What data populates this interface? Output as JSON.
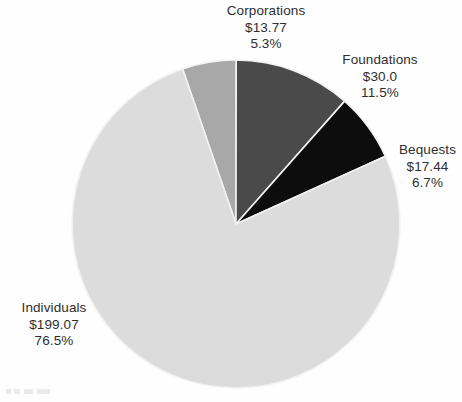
{
  "chart_data": {
    "type": "pie",
    "title": "",
    "subtitle": "",
    "xlabel": "",
    "ylabel": "",
    "legend_position": "none",
    "grid": false,
    "value_prefix": "$",
    "start_angle_deg": -19,
    "direction": "clockwise",
    "categories": [
      "Corporations",
      "Foundations",
      "Bequests",
      "Individuals"
    ],
    "values": [
      13.77,
      30.0,
      17.44,
      199.07
    ],
    "percents": [
      5.3,
      11.5,
      6.7,
      76.5
    ],
    "colors": [
      "#a8a8a8",
      "#4a4a4a",
      "#0d0d0d",
      "#dcdcdc"
    ],
    "slices": [
      {
        "name": "Corporations",
        "value": 13.77,
        "value_label": "$13.77",
        "percent": 5.3,
        "percent_label": "5.3%",
        "color": "#a8a8a8"
      },
      {
        "name": "Foundations",
        "value": 30.0,
        "value_label": "$30.0",
        "percent": 11.5,
        "percent_label": "11.5%",
        "color": "#4a4a4a"
      },
      {
        "name": "Bequests",
        "value": 17.44,
        "value_label": "$17.44",
        "percent": 6.7,
        "percent_label": "6.7%",
        "color": "#0d0d0d"
      },
      {
        "name": "Individuals",
        "value": 199.07,
        "value_label": "$199.07",
        "percent": 76.5,
        "percent_label": "76.5%",
        "color": "#dcdcdc"
      }
    ]
  },
  "labels": {
    "corporations": {
      "name": "Corporations",
      "value": "$13.77",
      "percent": "5.3%"
    },
    "foundations": {
      "name": "Foundations",
      "value": "$30.0",
      "percent": "11.5%"
    },
    "bequests": {
      "name": "Bequests",
      "value": "$17.44",
      "percent": "6.7%"
    },
    "individuals": {
      "name": "Individuals",
      "value": "$199.07",
      "percent": "76.5%"
    }
  },
  "geometry": {
    "center_x": 236,
    "center_y": 224,
    "radius": 164
  },
  "colors": {
    "background": "#fefefe",
    "text": "#2e2e2e",
    "slice_separator": "#f2f2f2"
  }
}
